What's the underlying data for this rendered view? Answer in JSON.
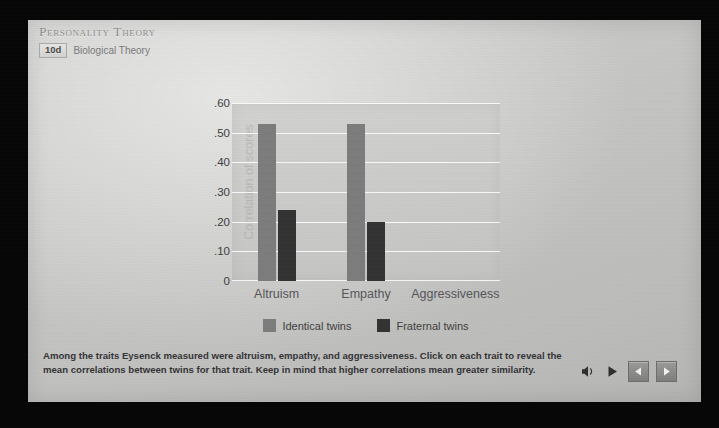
{
  "header": {
    "title": "Personality Theory",
    "badge": "10d",
    "section_label": "Biological Theory"
  },
  "chart_data": {
    "type": "bar",
    "title": "",
    "xlabel": "",
    "ylabel": "Correlation of scores",
    "categories": [
      "Altruism",
      "Empathy",
      "Aggressiveness"
    ],
    "series": [
      {
        "name": "Identical twins",
        "color": "#7c7c7c",
        "values": [
          0.53,
          0.53,
          null
        ]
      },
      {
        "name": "Fraternal twins",
        "color": "#323232",
        "values": [
          0.24,
          0.2,
          null
        ]
      }
    ],
    "ylim": [
      0,
      0.6
    ],
    "yticks": [
      "0",
      ".10",
      ".20",
      ".30",
      ".40",
      ".50",
      ".60"
    ],
    "ytick_values": [
      0,
      0.1,
      0.2,
      0.3,
      0.4,
      0.5,
      0.6
    ],
    "grid": true,
    "legend_position": "bottom"
  },
  "caption": {
    "text": "Among the traits Eysenck measured were altruism, empathy, and aggressiveness. Click on each trait to reveal the mean correlations between twins for that trait. Keep in mind that higher correlations mean greater similarity."
  },
  "controls": {
    "volume": "◂",
    "play": "▶",
    "previous": "◀",
    "next": "▶"
  }
}
